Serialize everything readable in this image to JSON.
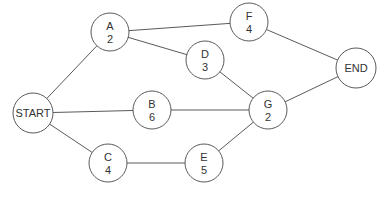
{
  "diagram": {
    "type": "activity-network",
    "colors": {
      "stroke": "#5a5a5a",
      "text": "#333333",
      "background": "#ffffff"
    },
    "nodes": [
      {
        "id": "START",
        "label": "START",
        "duration": "",
        "x": 33,
        "y": 113,
        "r": 20
      },
      {
        "id": "A",
        "label": "A",
        "duration": "2",
        "x": 110,
        "y": 32,
        "r": 19
      },
      {
        "id": "B",
        "label": "B",
        "duration": "6",
        "x": 152,
        "y": 110,
        "r": 19
      },
      {
        "id": "C",
        "label": "C",
        "duration": "4",
        "x": 108,
        "y": 163,
        "r": 19
      },
      {
        "id": "D",
        "label": "D",
        "duration": "3",
        "x": 205,
        "y": 60,
        "r": 19
      },
      {
        "id": "E",
        "label": "E",
        "duration": "5",
        "x": 204,
        "y": 163,
        "r": 19
      },
      {
        "id": "F",
        "label": "F",
        "duration": "4",
        "x": 249,
        "y": 22,
        "r": 19
      },
      {
        "id": "G",
        "label": "G",
        "duration": "2",
        "x": 268,
        "y": 110,
        "r": 19
      },
      {
        "id": "END",
        "label": "END",
        "duration": "",
        "x": 356,
        "y": 68,
        "r": 20
      }
    ],
    "edges": [
      {
        "from": "START",
        "to": "A"
      },
      {
        "from": "START",
        "to": "B"
      },
      {
        "from": "START",
        "to": "C"
      },
      {
        "from": "A",
        "to": "F"
      },
      {
        "from": "A",
        "to": "D"
      },
      {
        "from": "D",
        "to": "G"
      },
      {
        "from": "B",
        "to": "G"
      },
      {
        "from": "C",
        "to": "E"
      },
      {
        "from": "E",
        "to": "G"
      },
      {
        "from": "F",
        "to": "END"
      },
      {
        "from": "G",
        "to": "END"
      }
    ]
  }
}
